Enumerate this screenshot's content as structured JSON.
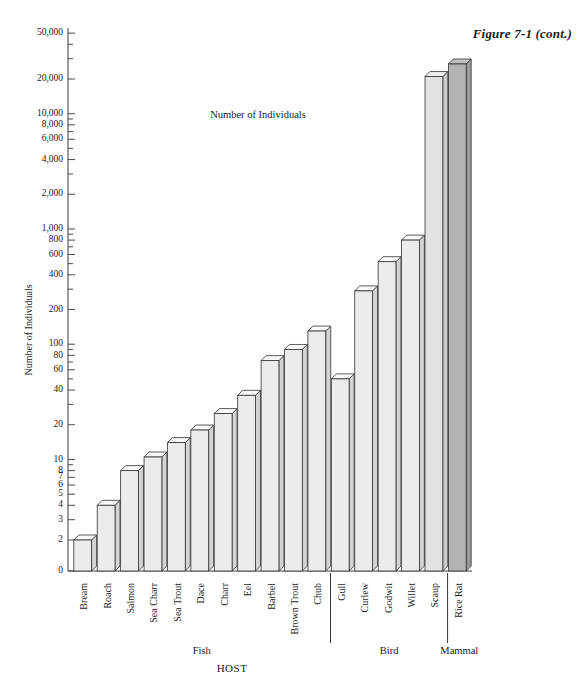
{
  "figure": {
    "label": "Figure 7-1 (cont.)"
  },
  "chart_data": {
    "type": "bar",
    "title": "",
    "annotation": "Number of Individuals",
    "xlabel": "HOST",
    "ylabel": "Number of Individuals",
    "yscale": "log",
    "ylim": [
      1.5,
      60000
    ],
    "grid": false,
    "legend": null,
    "categories": [
      "Bream",
      "Roach",
      "Salmon",
      "Sea Charr",
      "Sea Trout",
      "Dace",
      "Charr",
      "Eel",
      "Barbel",
      "Brown Trout",
      "Chub",
      "Gull",
      "Curlew",
      "Godwit",
      "Willet",
      "Scaup",
      "Rice Rat"
    ],
    "values": [
      2,
      4,
      8,
      10.5,
      14,
      18,
      25,
      36,
      72,
      90,
      130,
      50,
      290,
      520,
      800,
      21000,
      27000
    ],
    "groups": [
      {
        "name": "Fish",
        "start": 0,
        "end": 10
      },
      {
        "name": "Bird",
        "start": 11,
        "end": 15
      },
      {
        "name": "Mammal",
        "start": 16,
        "end": 16
      }
    ],
    "bar_colors": [
      "#ececec",
      "#ececec",
      "#ececec",
      "#ececec",
      "#ececec",
      "#ececec",
      "#ececec",
      "#ececec",
      "#ececec",
      "#ececec",
      "#ececec",
      "#ececec",
      "#ececec",
      "#ececec",
      "#ececec",
      "#e2e2e2",
      "#b3b3b3"
    ],
    "yticks": [
      {
        "value": 0,
        "label": "0"
      },
      {
        "value": 2,
        "label": "2"
      },
      {
        "value": 3,
        "label": "3"
      },
      {
        "value": 4,
        "label": "4"
      },
      {
        "value": 5,
        "label": "5"
      },
      {
        "value": 6,
        "label": "6"
      },
      {
        "value": 7,
        "label": "7"
      },
      {
        "value": 8,
        "label": "8"
      },
      {
        "value": 10,
        "label": "10"
      },
      {
        "value": 20,
        "label": "20"
      },
      {
        "value": 40,
        "label": "40"
      },
      {
        "value": 60,
        "label": "60"
      },
      {
        "value": 80,
        "label": "80"
      },
      {
        "value": 100,
        "label": "100"
      },
      {
        "value": 200,
        "label": "200"
      },
      {
        "value": 400,
        "label": "400"
      },
      {
        "value": 600,
        "label": "600"
      },
      {
        "value": 800,
        "label": "800"
      },
      {
        "value": 1000,
        "label": "1,000"
      },
      {
        "value": 2000,
        "label": "2,000"
      },
      {
        "value": 4000,
        "label": "4,000"
      },
      {
        "value": 6000,
        "label": "6,000"
      },
      {
        "value": 8000,
        "label": "8,000"
      },
      {
        "value": 10000,
        "label": "10,000"
      },
      {
        "value": 20000,
        "label": "20,000"
      },
      {
        "value": 50000,
        "label": "50,000"
      }
    ],
    "minor_yticks": [
      9,
      30,
      50,
      70,
      90,
      300,
      500,
      700,
      900,
      3000,
      5000,
      7000,
      9000,
      30000,
      40000
    ]
  }
}
